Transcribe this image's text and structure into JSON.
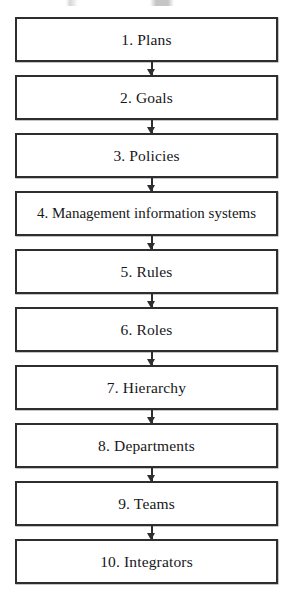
{
  "diagram": {
    "type": "vertical-flowchart",
    "orientation": "top-to-bottom",
    "node_count": 10,
    "connector_count": 9,
    "colors": {
      "background": "#ffffff",
      "box_fill": "#ffffff",
      "box_border": "#2e2e30",
      "text": "#17171a",
      "arrow": "#2e2e30"
    },
    "nodes": [
      {
        "id": 1,
        "number": "1.",
        "label": "Plans",
        "text": "1.  Plans"
      },
      {
        "id": 2,
        "number": "2.",
        "label": "Goals",
        "text": "2.  Goals"
      },
      {
        "id": 3,
        "number": "3.",
        "label": "Policies",
        "text": "3.  Policies"
      },
      {
        "id": 4,
        "number": "4.",
        "label": "Management information systems",
        "text": "4.  Management information systems"
      },
      {
        "id": 5,
        "number": "5.",
        "label": "Rules",
        "text": "5.  Rules"
      },
      {
        "id": 6,
        "number": "6.",
        "label": "Roles",
        "text": "6.  Roles"
      },
      {
        "id": 7,
        "number": "7.",
        "label": "Hierarchy",
        "text": "7.  Hierarchy"
      },
      {
        "id": 8,
        "number": "8.",
        "label": "Departments",
        "text": "8.  Departments"
      },
      {
        "id": 9,
        "number": "9.",
        "label": "Teams",
        "text": "9.  Teams"
      },
      {
        "id": 10,
        "number": "10.",
        "label": "Integrators",
        "text": "10.  Integrators"
      }
    ],
    "connectors": [
      {
        "from": 1,
        "to": 2,
        "glyph": "down-arrow"
      },
      {
        "from": 2,
        "to": 3,
        "glyph": "down-arrow"
      },
      {
        "from": 3,
        "to": 4,
        "glyph": "down-arrow"
      },
      {
        "from": 4,
        "to": 5,
        "glyph": "down-arrow"
      },
      {
        "from": 5,
        "to": 6,
        "glyph": "down-arrow"
      },
      {
        "from": 6,
        "to": 7,
        "glyph": "down-arrow"
      },
      {
        "from": 7,
        "to": 8,
        "glyph": "down-arrow"
      },
      {
        "from": 8,
        "to": 9,
        "glyph": "down-arrow"
      },
      {
        "from": 9,
        "to": 10,
        "glyph": "down-arrow"
      }
    ]
  }
}
